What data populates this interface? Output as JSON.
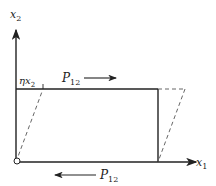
{
  "diagram": {
    "type": "shear-deformation",
    "axes": {
      "vertical_label": "x",
      "vertical_sub": "2",
      "horizontal_label": "x",
      "horizontal_sub": "1"
    },
    "labels": {
      "shear_offset_main": "ηx",
      "shear_offset_sub": "2",
      "force_top_main": "P",
      "force_top_sub": "12",
      "force_bottom_main": "P",
      "force_bottom_sub": "12"
    },
    "colors": {
      "stroke": "#222222",
      "dashed": "#555555",
      "background": "#ffffff"
    }
  }
}
